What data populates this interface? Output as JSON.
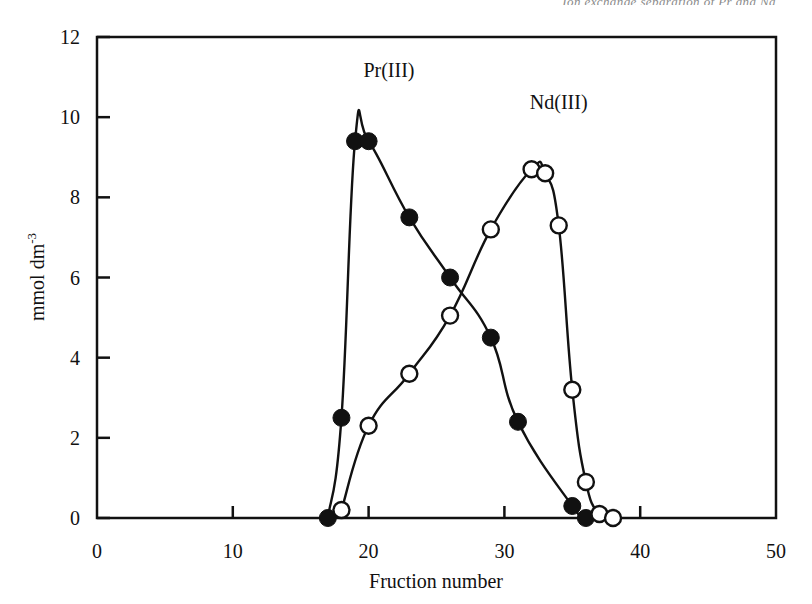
{
  "page": {
    "running_head": "Ion exchange separation of Pr and Nd"
  },
  "chart_data": {
    "type": "line",
    "title": "",
    "subtitle": "",
    "xlabel": "Fruction number",
    "ylabel": "mmol dm",
    "ylabel_superscript": "-3",
    "xlim": [
      0,
      50
    ],
    "ylim": [
      0,
      12
    ],
    "xticks": [
      0,
      10,
      20,
      30,
      40,
      50
    ],
    "yticks": [
      0,
      2,
      4,
      6,
      8,
      10,
      12
    ],
    "xtick_labels": [
      "0",
      "10",
      "20",
      "30",
      "40",
      "50"
    ],
    "ytick_labels": [
      "0",
      "2",
      "4",
      "6",
      "8",
      "10",
      "12"
    ],
    "grid": false,
    "legend_position": "inline-annotations",
    "series": [
      {
        "name": "Pr(III)",
        "marker": "filled-circle",
        "color": "#111111",
        "label_x": 21.5,
        "label_y": 11.0,
        "x": [
          17,
          18,
          19,
          20,
          23,
          26,
          29,
          31,
          35,
          36
        ],
        "y": [
          0.0,
          2.5,
          9.4,
          9.4,
          7.5,
          6.0,
          4.5,
          2.4,
          0.3,
          0.0
        ]
      },
      {
        "name": "Nd(III)",
        "marker": "open-circle",
        "color": "#111111",
        "label_x": 34.0,
        "label_y": 10.2,
        "x": [
          18,
          20,
          23,
          26,
          29,
          32,
          33,
          34,
          35,
          36,
          37,
          38
        ],
        "y": [
          0.2,
          2.3,
          3.6,
          5.05,
          7.2,
          8.7,
          8.6,
          7.3,
          3.2,
          0.9,
          0.1,
          0.0
        ]
      }
    ],
    "annotations": [
      {
        "text": "Pr(III)",
        "x": 21.5,
        "y": 11.0
      },
      {
        "text": "Nd(III)",
        "x": 34.0,
        "y": 10.2
      }
    ]
  }
}
